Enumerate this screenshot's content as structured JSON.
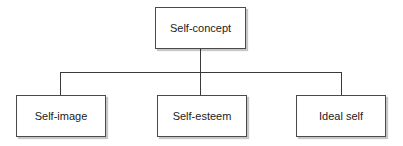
{
  "diagram": {
    "type": "hierarchy",
    "root": {
      "label": "Self-concept"
    },
    "children": [
      {
        "label": "Self-image"
      },
      {
        "label": "Self-esteem"
      },
      {
        "label": "Ideal self"
      }
    ],
    "colors": {
      "border": "#4a4a4a",
      "line": "#3a3a3a",
      "text": "#222222",
      "background": "#ffffff"
    }
  }
}
